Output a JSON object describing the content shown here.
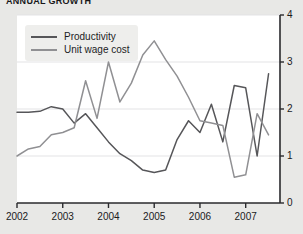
{
  "chart_data": {
    "type": "line",
    "title": "ANNUAL GROWTH",
    "xlabel": "",
    "ylabel": "",
    "ylim": [
      0,
      4
    ],
    "xlim": [
      2002.0,
      2007.75
    ],
    "grid": true,
    "grid_axis": "y",
    "legend_position": "top-left",
    "yticks": [
      "0",
      "1",
      "2",
      "3",
      "4"
    ],
    "ytick_values": [
      0,
      1,
      2,
      3,
      4
    ],
    "xticks": [
      "2002",
      "2003",
      "2004",
      "2005",
      "2006",
      "2007"
    ],
    "xtick_values": [
      2002,
      2003,
      2004,
      2005,
      2006,
      2007
    ],
    "series": [
      {
        "name": "Productivity",
        "color": "#565659",
        "x": [
          2002.0,
          2002.25,
          2002.5,
          2002.75,
          2003.0,
          2003.25,
          2003.5,
          2003.75,
          2004.0,
          2004.25,
          2004.5,
          2004.75,
          2005.0,
          2005.25,
          2005.5,
          2005.75,
          2006.0,
          2006.25,
          2006.5,
          2006.75,
          2007.0,
          2007.25,
          2007.5
        ],
        "values": [
          1.93,
          1.93,
          1.95,
          2.05,
          2.0,
          1.7,
          1.9,
          1.6,
          1.3,
          1.05,
          0.9,
          0.7,
          0.65,
          0.7,
          1.35,
          1.75,
          1.5,
          2.1,
          1.3,
          2.5,
          2.45,
          1.0,
          2.75
        ]
      },
      {
        "name": "Unit wage cost",
        "color": "#909093",
        "x": [
          2002.0,
          2002.25,
          2002.5,
          2002.75,
          2003.0,
          2003.25,
          2003.5,
          2003.75,
          2004.0,
          2004.25,
          2004.5,
          2004.75,
          2005.0,
          2005.25,
          2005.5,
          2005.75,
          2006.0,
          2006.25,
          2006.5,
          2006.75,
          2007.0,
          2007.25,
          2007.5
        ],
        "values": [
          1.0,
          1.15,
          1.2,
          1.45,
          1.5,
          1.6,
          2.6,
          1.8,
          3.0,
          2.15,
          2.55,
          3.15,
          3.45,
          3.05,
          2.7,
          2.25,
          1.75,
          1.7,
          1.65,
          0.55,
          0.6,
          1.9,
          1.45
        ]
      }
    ]
  },
  "legend": {
    "items": [
      {
        "label": "Productivity",
        "color": "#565659"
      },
      {
        "label": "Unit wage cost",
        "color": "#909093"
      }
    ]
  },
  "axes": {
    "y_axis_color": "#2a2a2d",
    "x_axis_color": "#2a2a2d",
    "gridline_color": "#e3e3e5"
  },
  "theme": {
    "page_background": "#e8e8e6",
    "plot_background": "#ffffff",
    "text_color": "#1a1a1d"
  }
}
